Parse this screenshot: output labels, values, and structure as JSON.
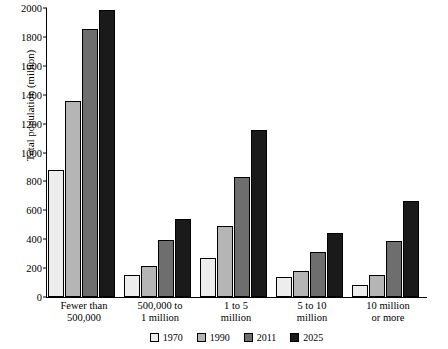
{
  "chart_data": {
    "type": "bar",
    "title": "",
    "xlabel": "",
    "ylabel": "Total population (million)",
    "categories": [
      "Fewer than 500,000",
      "500,000 to 1 million",
      "1 to 5 million",
      "5 to 10 million",
      "10 million or more"
    ],
    "series": [
      {
        "name": "1970",
        "color": "#ededed",
        "values": [
          880,
          150,
          270,
          140,
          80
        ]
      },
      {
        "name": "1990",
        "color": "#b5b5b5",
        "values": [
          1355,
          215,
          490,
          180,
          150
        ]
      },
      {
        "name": "2011",
        "color": "#6e6e6e",
        "values": [
          1855,
          395,
          830,
          310,
          390
        ]
      },
      {
        "name": "2025",
        "color": "#1a1a1a",
        "values": [
          1985,
          540,
          1155,
          445,
          665
        ]
      }
    ],
    "ylim": [
      0,
      2000
    ],
    "yticks": [
      0,
      200,
      400,
      600,
      800,
      1000,
      1200,
      1400,
      1600,
      1800,
      2000
    ],
    "grid": false,
    "legend_position": "bottom"
  }
}
